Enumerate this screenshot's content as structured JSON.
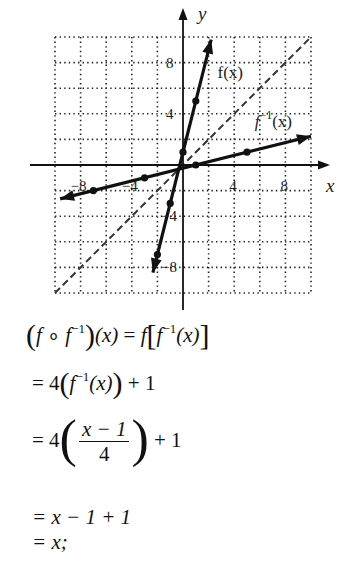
{
  "chart_data": {
    "type": "line",
    "title": "",
    "xlabel": "x",
    "ylabel": "y",
    "xlim": [
      -10,
      10
    ],
    "ylim": [
      -10,
      10
    ],
    "grid": true,
    "grid_step": 2,
    "x_ticks": [
      -8,
      -4,
      4,
      8
    ],
    "y_ticks": [
      8,
      4,
      -4,
      -8
    ],
    "x_tick_labels": [
      "-8",
      "-4",
      "4",
      "8"
    ],
    "y_tick_labels": [
      "8",
      "4",
      "-4",
      "-8"
    ],
    "series": [
      {
        "name": "f(x)",
        "label": "f(x)",
        "formula": "f(x) = 4x + 1",
        "style": "solid",
        "points": [
          [
            -2,
            -7
          ],
          [
            -1,
            -3
          ],
          [
            0,
            1
          ],
          [
            1,
            5
          ]
        ],
        "line_extent": [
          [
            -2.35,
            -8.4
          ],
          [
            2.2,
            9.8
          ]
        ]
      },
      {
        "name": "f^-1(x)",
        "label": "f⁻¹(x)",
        "formula": "f^-1(x) = (x - 1)/4",
        "style": "solid",
        "points": [
          [
            -7,
            -2
          ],
          [
            -3,
            -1
          ],
          [
            1,
            0
          ],
          [
            5,
            1
          ]
        ],
        "line_extent": [
          [
            -9.6,
            -2.65
          ],
          [
            10,
            2.25
          ]
        ]
      },
      {
        "name": "y = x",
        "label": "",
        "style": "dashed",
        "points": [
          [
            -10,
            -10
          ],
          [
            10,
            10
          ]
        ]
      }
    ],
    "annotations": [
      {
        "text": "f(x)",
        "x": 2.7,
        "y": 6.8
      },
      {
        "text": "f⁻¹(x)",
        "x": 5.6,
        "y": 3.0
      }
    ]
  },
  "derivation": {
    "line1": {
      "lhs_open": "(",
      "f": "f",
      "compose": " ∘ ",
      "finv": "f",
      "inv_exp": "−1",
      "lhs_close": ")",
      "arg": "(x)",
      "eq": " = ",
      "rhs_f": "f",
      "rhs_bracket_open": "[",
      "rhs_finv": "f",
      "rhs_inv_exp": "−1",
      "rhs_arg": "(x)",
      "rhs_bracket_close": "]"
    },
    "line2": {
      "prefix": "= 4",
      "open": "(",
      "f": "f",
      "inv_exp": "−1",
      "arg": "(x)",
      "close": ")",
      "suffix": " + 1"
    },
    "line3": {
      "prefix": "= 4",
      "numerator": "x − 1",
      "denominator": "4",
      "suffix": " + 1"
    },
    "line4": {
      "text": "= x − 1 + 1"
    },
    "line5": {
      "text": "= x;"
    }
  }
}
